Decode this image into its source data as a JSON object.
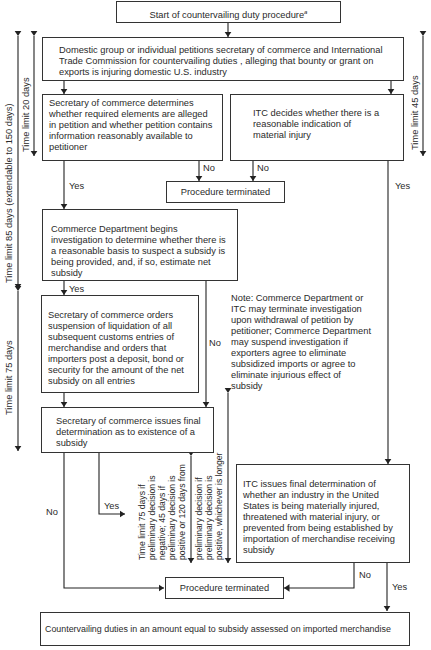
{
  "diagram": {
    "start": {
      "label": "Start of countervailing duty procedure",
      "footnote_mark": "a"
    },
    "petition": {
      "label": "Domestic group or individual petitions secretary of commerce and International Trade Commission for countervailing duties , alleging that bounty or grant on exports is injuring domestic U.S. industry"
    },
    "secretary_determines": {
      "label": "Secretary of commerce determines whether required elements are alleged in petition and whether petition contains information reasonably available to petitioner"
    },
    "itc_decides": {
      "label": "ITC decides whether there is a reasonable indication of material injury"
    },
    "terminated_1": {
      "label": "Procedure terminated"
    },
    "commerce_investigation": {
      "label": "Commerce Department begins investigation to determine whether there is a reasonable basis to suspect a subsidy is being provided, and, if so, estimate net subsidy"
    },
    "secretary_orders": {
      "label": "Secretary of commerce orders suspension of liquidation of all subsequent customs entries of merchandise and orders that importers post a deposit, bond or security for the amount of the net subsidy on all entries"
    },
    "note": {
      "label": "Note: Commerce Department or ITC may terminate investigation upon withdrawal of petition by petitioner; Commerce Department may suspend investigation if exporters agree to eliminate subsidized imports or agree to eliminate injurious effect of subsidy"
    },
    "secretary_final": {
      "label": "Secretary of commerce issues final determination as to existence of a subsidy"
    },
    "itc_final": {
      "label": "ITC issues final determination of whether an industry in the United States is being materially injured, threatened with material injury, or prevented from being established by importation of merchandise receiving subsidy"
    },
    "terminated_2": {
      "label": "Procedure terminated"
    },
    "duties_assessed": {
      "label": "Countervailing duties in an amount equal to subsidy assessed on imported merchandise"
    },
    "edge_labels": {
      "no_1": "No",
      "no_2": "No",
      "yes_secretary": "Yes",
      "yes_itc": "Yes",
      "yes_commerce": "Yes",
      "no_commerce": "No",
      "yes_final": "Yes",
      "no_final_left": "No",
      "no_itc_final": "No",
      "yes_itc_final": "Yes"
    },
    "time_limits": {
      "left_outer": "Time limit 85 days (extendable to 150 days)",
      "left_inner": "Time limit 20 days",
      "left_lower": "Time limit 75 days",
      "right": "Time limit 45 days",
      "middle_a": "Time limit 75 days if preliminary decision is negative; 45 days if preliminary decision is positive or 120 days from",
      "middle_b": "preliminary decision if preliminary decision is positive, whichever is longer"
    },
    "middle_a_lines": [
      "Time limit 75 days if",
      "preliminary decision is",
      "negative; 45 days if",
      "preliminary decision is",
      "positive or 120 days from"
    ],
    "middle_b_lines": [
      "preliminary decision if",
      "preliminary decision is",
      "positive, whichever is longer"
    ]
  }
}
